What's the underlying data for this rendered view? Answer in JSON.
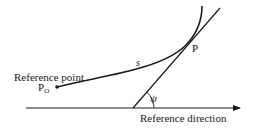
{
  "diagram": {
    "labels": {
      "point_p": "P",
      "arc_length": "s",
      "reference_point": "Reference point",
      "p0_main": "P",
      "p0_sub": "O",
      "angle": "ψ",
      "reference_direction": "Reference direction"
    },
    "colors": {
      "stroke": "#1a1a1a",
      "background": "#ffffff"
    }
  }
}
